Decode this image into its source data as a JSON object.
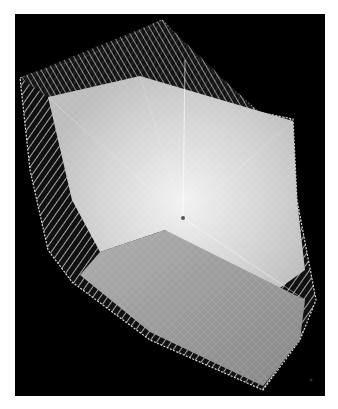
{
  "figure": {
    "background_color": "#000000",
    "page_color": "#ffffff",
    "colors": {
      "upper_face": "#d9d9d9",
      "lower_face": "#9a9a9a",
      "wire": "#e8e8e8",
      "center_point": "#555555"
    },
    "center_point": [
      183,
      218
    ]
  }
}
